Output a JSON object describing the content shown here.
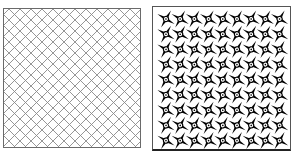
{
  "panels": [
    {
      "id": "left",
      "kind": "diagonal-lattice",
      "line_color": "#8a8a8a",
      "spacing": 11,
      "angle_deg": 45
    },
    {
      "id": "right",
      "kind": "pinwheel-star-tiling",
      "rows": 9,
      "cols": 9,
      "motif_color": "#000000",
      "background": "#ffffff"
    }
  ]
}
